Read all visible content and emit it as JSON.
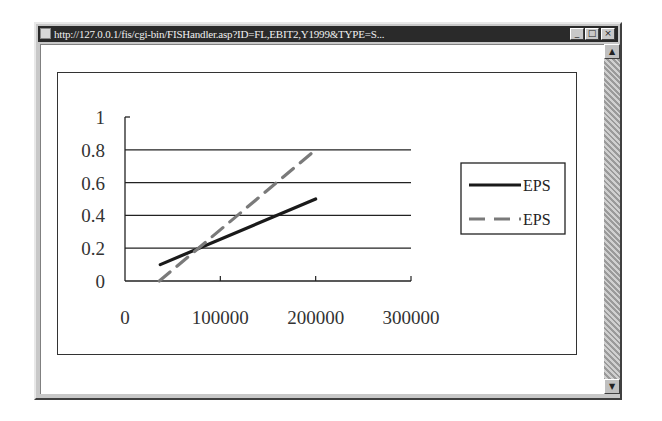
{
  "window": {
    "title": "http://127.0.0.1/fis/cgi-bin/FISHandler.asp?ID=FL,EBIT2,Y1999&TYPE=S...",
    "buttons": {
      "minimize": "_",
      "maximize": "□",
      "close": "×"
    },
    "scrollbar": {
      "up": "▲",
      "down": "▼"
    }
  },
  "chart_data": {
    "type": "line",
    "title": "",
    "xlabel": "",
    "ylabel": "",
    "xlim": [
      0,
      300000
    ],
    "ylim": [
      0,
      1
    ],
    "x_ticks": [
      "0",
      "100000",
      "200000",
      "300000"
    ],
    "y_ticks": [
      "0",
      "0.2",
      "0.4",
      "0.6",
      "0.8",
      "1"
    ],
    "grid": "horizontal",
    "legend_position": "right",
    "series": [
      {
        "name": "EPS",
        "style": "solid",
        "color": "#1a1a1a",
        "x": [
          37000,
          200000
        ],
        "y": [
          0.1,
          0.5
        ]
      },
      {
        "name": "EPS",
        "style": "dashed",
        "color": "#7a7a7a",
        "x": [
          36000,
          200000
        ],
        "y": [
          0.0,
          0.8
        ]
      }
    ]
  }
}
